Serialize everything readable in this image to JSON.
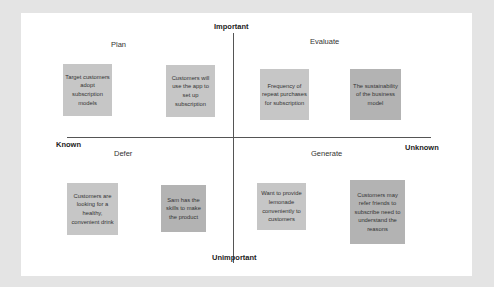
{
  "diagram": {
    "axes": {
      "top": "Important",
      "bottom": "Unimportant",
      "left": "Known",
      "right": "Unknown"
    },
    "quadrants": {
      "plan": {
        "label": "Plan",
        "notes": [
          {
            "text": "Target customers adopt subscription models",
            "color": "#c6c6c6"
          },
          {
            "text": "Customers will use the app to set up subscription",
            "color": "#c6c6c6"
          }
        ]
      },
      "evaluate": {
        "label": "Evaluate",
        "notes": [
          {
            "text": "Frequency of repeat purchases for subscription",
            "color": "#c6c6c6"
          },
          {
            "text": "The sustainability of the business model",
            "color": "#b3b3b3"
          }
        ]
      },
      "defer": {
        "label": "Defer",
        "notes": [
          {
            "text": "Customers are looking for a healthy, convenient drink",
            "color": "#c6c6c6"
          },
          {
            "text": "Sam has the skills to make the product",
            "color": "#b3b3b3"
          }
        ]
      },
      "generate": {
        "label": "Generate",
        "notes": [
          {
            "text": "Want to provide lemonade conveniently to customers",
            "color": "#c6c6c6"
          },
          {
            "text": "Customers may refer friends to subscribe need to understand the reasons",
            "color": "#b3b3b3"
          }
        ]
      }
    },
    "colors": {
      "background": "#e4e4e4",
      "card": "#ffffff",
      "axis": "#555555"
    }
  }
}
